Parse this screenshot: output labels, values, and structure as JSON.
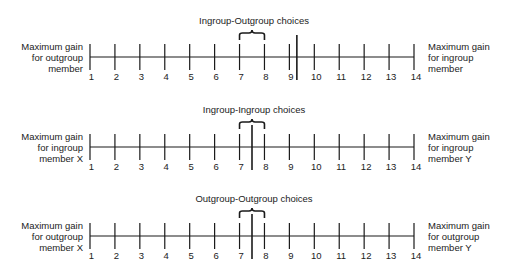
{
  "figure": {
    "scales": [
      {
        "id": "ingroup-outgroup",
        "title": "Ingroup-Outgroup choices",
        "left_label": [
          "Maximum gain",
          "for outgroup",
          "member"
        ],
        "right_label": [
          "Maximum gain",
          "for ingroup",
          "member"
        ],
        "brace_range": [
          7,
          8
        ],
        "marker_value": 9.3
      },
      {
        "id": "ingroup-ingroup",
        "title": "Ingroup-Ingroup choices",
        "left_label": [
          "Maximum gain",
          "for ingroup",
          "member X"
        ],
        "right_label": [
          "Maximum gain",
          "for ingroup",
          "member Y"
        ],
        "brace_range": [
          7,
          8
        ],
        "marker_value": 7.5
      },
      {
        "id": "outgroup-outgroup",
        "title": "Outgroup-Outgroup choices",
        "left_label": [
          "Maximum gain",
          "for outgroup",
          "member X"
        ],
        "right_label": [
          "Maximum gain",
          "for outgroup",
          "member Y"
        ],
        "brace_range": [
          7,
          8
        ],
        "marker_value": 7.5
      }
    ],
    "ticks": [
      "1",
      "2",
      "3",
      "4",
      "5",
      "6",
      "7",
      "8",
      "9",
      "10",
      "11",
      "12",
      "13",
      "14"
    ],
    "colors": {
      "line": "#1a1a1a",
      "text": "#222222",
      "background": "#ffffff"
    }
  }
}
